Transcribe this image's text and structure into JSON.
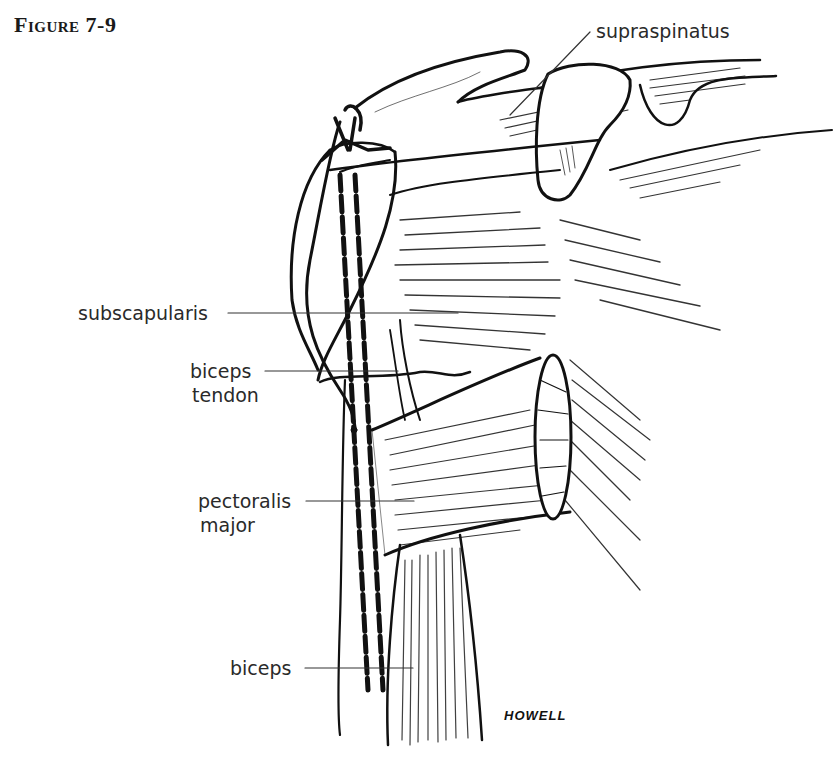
{
  "figure": {
    "title": "Figure 7-9",
    "artist_signature": "HOWELL"
  },
  "labels": {
    "supraspinatus": "supraspinatus",
    "subscapularis": "subscapularis",
    "biceps_tendon_line1": "biceps",
    "biceps_tendon_line2": "tendon",
    "pectoralis_major_line1": "pectoralis",
    "pectoralis_major_line2": "major",
    "biceps": "biceps"
  },
  "colors": {
    "ink": "#111111",
    "label_text": "#2a2a2a",
    "background": "#ffffff"
  }
}
